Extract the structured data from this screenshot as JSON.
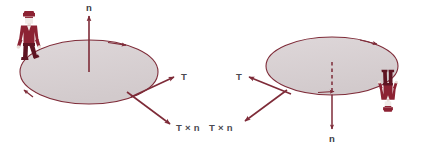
{
  "figure": {
    "background_color": "#ffffff",
    "palette": {
      "outline": "#7e2b38",
      "disk_fill": "#d8d0d2",
      "arrow": "#7e2b38",
      "person": "#8c2233",
      "person_dark": "#5e1422",
      "label_text": "#4a4a52",
      "dashed": "#7e2b38"
    },
    "panels": [
      {
        "id": "left-panel",
        "name": "upward-normal-panel",
        "disk": {
          "cx": 89,
          "cy": 72,
          "rx": 69,
          "ry": 32,
          "rim_arrow_positions": [
            "top-right",
            "left-lower"
          ]
        },
        "normal_vector": {
          "label": "n",
          "style": "solid",
          "direction": "up",
          "from": {
            "x": 89,
            "y": 72
          },
          "to": {
            "x": 89,
            "y": 14
          },
          "label_x": 86,
          "label_y": 11
        },
        "tangent_vector": {
          "label": "T",
          "from": {
            "x": 132,
            "y": 96
          },
          "to": {
            "x": 176,
            "y": 76
          },
          "label_x": 181,
          "label_y": 80
        },
        "cross_vector": {
          "label": "T × n",
          "from": {
            "x": 128,
            "y": 92
          },
          "to": {
            "x": 172,
            "y": 125
          },
          "label_x": 176,
          "label_y": 131
        },
        "person": {
          "orientation": "upright",
          "x": 30,
          "y": 44,
          "description": "person standing upright on top of the disk"
        }
      },
      {
        "id": "right-panel",
        "name": "downward-normal-panel",
        "disk": {
          "cx": 332,
          "cy": 66,
          "rx": 66,
          "ry": 29,
          "rim_arrow_positions": [
            "top-right",
            "bottom-center"
          ]
        },
        "normal_vector": {
          "label": "n",
          "style": "dashed-then-solid",
          "direction": "down",
          "from": {
            "x": 332,
            "y": 62
          },
          "to": {
            "x": 332,
            "y": 130
          },
          "label_x": 329,
          "label_y": 142
        },
        "tangent_vector": {
          "label": "T",
          "from": {
            "x": 290,
            "y": 93
          },
          "to": {
            "x": 247,
            "y": 76
          },
          "label_x": 236,
          "label_y": 80
        },
        "cross_vector": {
          "label": "T × n",
          "from": {
            "x": 286,
            "y": 90
          },
          "to": {
            "x": 243,
            "y": 122
          },
          "label_x": 209,
          "label_y": 131
        },
        "person": {
          "orientation": "inverted",
          "x": 388,
          "y": 92,
          "description": "person hanging upside down beneath the disk"
        }
      }
    ]
  }
}
